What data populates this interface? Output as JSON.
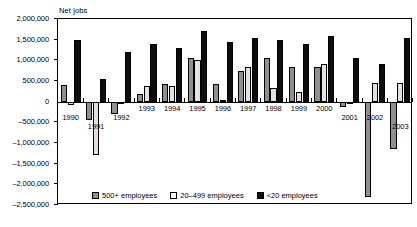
{
  "chart_data": {
    "type": "bar",
    "title": "",
    "ylabel": "Net jobs",
    "xlabel": "",
    "grid": false,
    "legend_position": "bottom",
    "ylim": [
      -2500000,
      2000000
    ],
    "yticks": [
      2000000,
      1500000,
      1000000,
      500000,
      0,
      -500000,
      -1000000,
      -1500000,
      -2000000,
      -2500000
    ],
    "ytick_labels": [
      "2,000,000",
      "1,500,000",
      "1,000,000",
      "500,000",
      "0",
      "-500,000",
      "-1,000,000",
      "-1,500,000",
      "-2,000,000",
      "-2,500,000"
    ],
    "categories": [
      "1990",
      "1991",
      "1992",
      "1993",
      "1994",
      "1995",
      "1996",
      "1997",
      "1998",
      "1999",
      "2000",
      "2001",
      "2002",
      "2003"
    ],
    "series": [
      {
        "name": "500+ employees",
        "color": "#8f8f8f",
        "values": [
          400000,
          -450000,
          -300000,
          180000,
          430000,
          1050000,
          420000,
          750000,
          1050000,
          850000,
          850000,
          -120000,
          -2300000,
          -1150000
        ]
      },
      {
        "name": "20–499 employees",
        "color": "#e2e2e2",
        "values": [
          -80000,
          -1300000,
          0,
          380000,
          370000,
          1000000,
          30000,
          850000,
          330000,
          230000,
          900000,
          -30000,
          450000,
          450000
        ]
      },
      {
        "name": "<20 employees",
        "color": "#0d0d0d",
        "values": [
          1500000,
          550000,
          1200000,
          1400000,
          1300000,
          1700000,
          1450000,
          1550000,
          1500000,
          1400000,
          1600000,
          1050000,
          900000,
          1550000
        ]
      }
    ]
  },
  "legend": {
    "items": [
      {
        "label": "500+ employees",
        "swatch": "s500"
      },
      {
        "label": "20–499 employees",
        "swatch": "s20499"
      },
      {
        "label": "<20 employees",
        "swatch": "slt20"
      }
    ]
  },
  "axis": {
    "y_title": "Net jobs"
  }
}
